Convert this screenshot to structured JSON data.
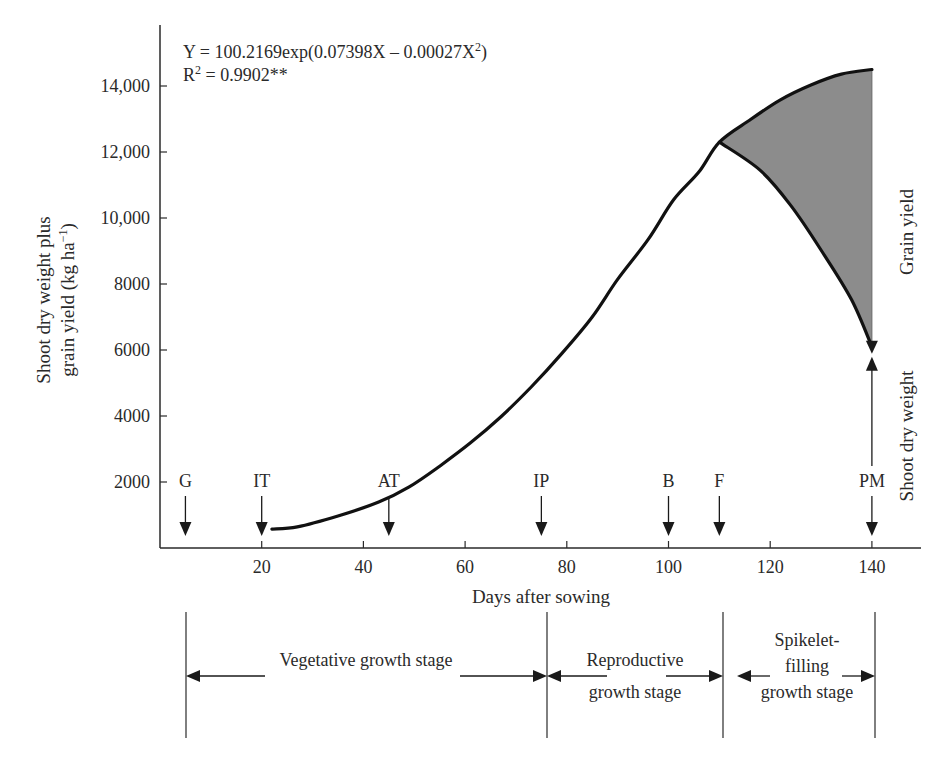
{
  "chart_data": {
    "type": "line",
    "title": "",
    "equation": "Y = 100.2169exp(0.07398X – 0.00027X²)",
    "equation_parts": {
      "main": "Y = 100.2169exp(0.07398X – 0.00027X",
      "sup": "2",
      "tail": ")"
    },
    "r2": {
      "prefix": "R",
      "sup": "2",
      "value": " = 0.9902**"
    },
    "xlabel": "Days after sowing",
    "ylabel_line1": "Shoot dry weight plus",
    "ylabel_line2_main": "grain yield (kg ha",
    "ylabel_line2_sup": "−1",
    "ylabel_line2_tail": ")",
    "xlim": [
      0,
      150
    ],
    "ylim": [
      0,
      15500
    ],
    "x_ticks": [
      20,
      40,
      60,
      80,
      100,
      120,
      140
    ],
    "y_ticks": [
      {
        "value": 2000,
        "label": "2000"
      },
      {
        "value": 4000,
        "label": "4000"
      },
      {
        "value": 6000,
        "label": "6000"
      },
      {
        "value": 8000,
        "label": "8000"
      },
      {
        "value": 10000,
        "label": "10,000"
      },
      {
        "value": 12000,
        "label": "12,000"
      },
      {
        "value": 14000,
        "label": "14,000"
      }
    ],
    "grid": false,
    "series": [
      {
        "name": "Shoot dry weight plus grain yield",
        "x": [
          22,
          27,
          35,
          43,
          49,
          55,
          61,
          67,
          73,
          79,
          85,
          90,
          96,
          101,
          106,
          110,
          116,
          122,
          128,
          134,
          140
        ],
        "y": [
          570,
          640,
          970,
          1390,
          1850,
          2480,
          3180,
          3970,
          4880,
          5890,
          7000,
          8140,
          9350,
          10550,
          11400,
          12300,
          12970,
          13580,
          14030,
          14360,
          14500
        ]
      },
      {
        "name": "Shoot dry weight",
        "x": [
          110,
          118,
          124,
          130,
          136,
          140
        ],
        "y": [
          12300,
          11450,
          10390,
          9030,
          7520,
          6100
        ]
      }
    ],
    "shaded_region": {
      "label": "Grain yield",
      "x_range": [
        110,
        140
      ],
      "color": "#8c8c8c"
    },
    "right_labels": {
      "grain_yield": "Grain yield",
      "shoot_dry_weight": "Shoot dry weight"
    },
    "stage_markers": [
      {
        "label": "G",
        "day": 5
      },
      {
        "label": "IT",
        "day": 20
      },
      {
        "label": "AT",
        "day": 45
      },
      {
        "label": "IP",
        "day": 75
      },
      {
        "label": "B",
        "day": 100
      },
      {
        "label": "F",
        "day": 110
      },
      {
        "label": "PM",
        "day": 140
      }
    ],
    "growth_stages": [
      {
        "lines": [
          "Vegetative growth stage"
        ],
        "start_day": 5,
        "end_day": 76
      },
      {
        "lines": [
          "Reproductive",
          "growth stage"
        ],
        "start_day": 76,
        "end_day": 110
      },
      {
        "lines": [
          "Spikelet-",
          "filling",
          "growth stage"
        ],
        "start_day": 110,
        "end_day": 140
      }
    ]
  }
}
